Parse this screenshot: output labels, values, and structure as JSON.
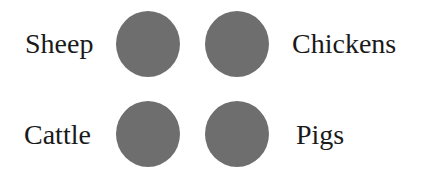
{
  "items": [
    {
      "label": "Sheep",
      "position": "top-left"
    },
    {
      "label": "Chickens",
      "position": "top-right"
    },
    {
      "label": "Cattle",
      "position": "bottom-left"
    },
    {
      "label": "Pigs",
      "position": "bottom-right"
    }
  ],
  "colors": {
    "circle": "#6e6e6e",
    "text": "#1a1a1a",
    "background": "#ffffff"
  }
}
